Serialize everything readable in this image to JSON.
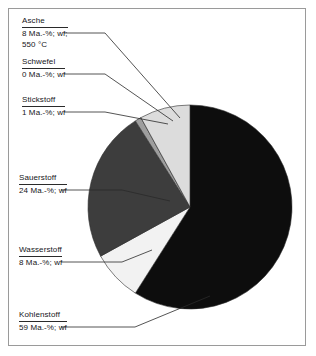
{
  "figure": {
    "background_color": "#ffffff",
    "frame_color": "#9a9a9a",
    "leader_line_color": "#2a2a2a"
  },
  "chart_data": {
    "type": "pie",
    "title": "",
    "subtitle": "",
    "xlabel": "",
    "ylabel": "",
    "grid": false,
    "legend_position": "callout-labels-left",
    "units": "Ma.-%",
    "basis": "wf",
    "center": {
      "x": 190,
      "y": 207
    },
    "radius": 102,
    "start_angle_deg": 0,
    "direction": "clockwise",
    "categories": [
      "Kohlenstoff",
      "Wasserstoff",
      "Sauerstoff",
      "Stickstoff",
      "Schwefel",
      "Asche"
    ],
    "values": [
      59,
      8,
      24,
      1,
      0,
      8
    ],
    "slices": [
      {
        "label": "Kohlenstoff",
        "value": 59,
        "value_text": "59 Ma.-%; wf",
        "color": "#0d0d0d",
        "start_deg": 0,
        "end_deg": 212.4
      },
      {
        "label": "Wasserstoff",
        "value": 8,
        "value_text": "8 Ma.-%; wf",
        "color": "#f2f2f2",
        "start_deg": 212.4,
        "end_deg": 241.2
      },
      {
        "label": "Sauerstoff",
        "value": 24,
        "value_text": "24 Ma.-%; wf",
        "color": "#3d3d3d",
        "start_deg": 241.2,
        "end_deg": 327.6
      },
      {
        "label": "Stickstoff",
        "value": 1,
        "value_text": "1 Ma.-%; wf",
        "color": "#9e9e9e",
        "start_deg": 327.6,
        "end_deg": 331.2
      },
      {
        "label": "Schwefel",
        "value": 0,
        "value_text": "0 Ma.-%; wf",
        "color": "#c9c9c9",
        "start_deg": 331.2,
        "end_deg": 331.2
      },
      {
        "label": "Asche",
        "value": 8,
        "value_text": "8 Ma.-%; wf",
        "value_text2": "550 °C",
        "color": "#dcdcdc",
        "start_deg": 331.2,
        "end_deg": 360
      }
    ]
  },
  "callouts": {
    "asche": {
      "name": "Asche",
      "value": "8 Ma.-%; wf;",
      "value2": "550 °C"
    },
    "schwefel": {
      "name": "Schwefel",
      "value": "0 Ma.-%; wf"
    },
    "stickstoff": {
      "name": "Stickstoff",
      "value": "1 Ma.-%; wf"
    },
    "sauerstoff": {
      "name": "Sauerstoff",
      "value": "24 Ma.-%; wf"
    },
    "wasserstoff": {
      "name": "Wasserstoff",
      "value": "8 Ma.-%; wf"
    },
    "kohlenstoff": {
      "name": "Kohlenstoff",
      "value": "59 Ma.-%; wf"
    }
  }
}
